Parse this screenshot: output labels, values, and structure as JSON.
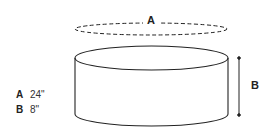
{
  "diagram": {
    "shape": "cylinder",
    "dimension_labels": {
      "diameter": "A",
      "height": "B"
    },
    "legend": [
      {
        "key": "A",
        "value": "24\""
      },
      {
        "key": "B",
        "value": "8\""
      }
    ],
    "colors": {
      "stroke": "#222222",
      "background": "#ffffff"
    }
  }
}
